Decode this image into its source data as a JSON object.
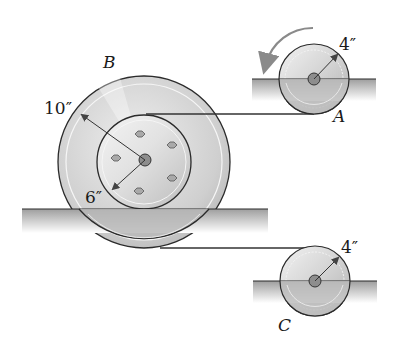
{
  "diagram": {
    "type": "mechanics-pulley-system",
    "colors": {
      "wheel_light": "#e6e6e6",
      "wheel_mid": "#bdbdbd",
      "wheel_dark": "#9a9a9a",
      "ground_top": "#9e9e9e",
      "ground_fade": "#ffffff",
      "outline": "#2b2b2b",
      "arrow": "#8a8a8a"
    },
    "wheels": [
      {
        "id": "B",
        "label": "B",
        "outer_radius_label": "10″",
        "inner_radius_label": "6″",
        "bolts": 6
      },
      {
        "id": "A",
        "label": "A",
        "radius_label": "4″",
        "rotation": "counterclockwise"
      },
      {
        "id": "C",
        "label": "C",
        "radius_label": "4″"
      }
    ],
    "cables": [
      {
        "from": "B-hub-top",
        "to": "A-bottom"
      },
      {
        "from": "B-rim-bottom",
        "to": "C-top"
      }
    ]
  }
}
